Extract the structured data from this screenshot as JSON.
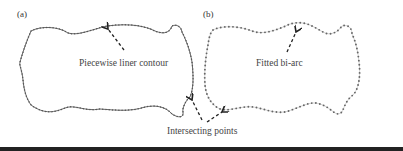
{
  "figure": {
    "panels": [
      {
        "id": "a",
        "label": "(a)",
        "style": "piecewise-linear",
        "annotation": "Piecewise liner contour"
      },
      {
        "id": "b",
        "label": "(b)",
        "style": "bi-arc-dotted",
        "annotation": "Fitted bi-arc"
      }
    ],
    "shared_annotation": "Intersecting points",
    "colors": {
      "contour_a": "#555555",
      "contour_b_points": "#666666",
      "contour_b_line": "#c8c8c8",
      "arrow": "#222222",
      "text": "#444444",
      "bottom_bar": "#222222"
    }
  }
}
